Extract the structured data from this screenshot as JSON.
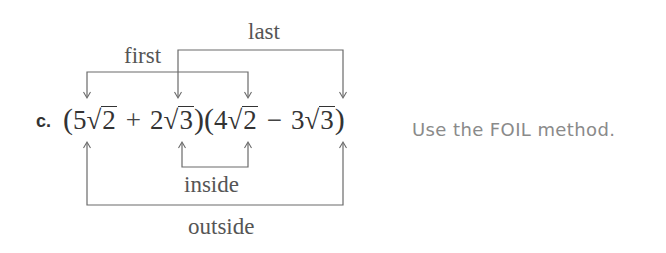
{
  "problem": {
    "item_letter": "c.",
    "expression": {
      "open_paren_1": "(",
      "term1": {
        "coefficient": "5",
        "radical_sign": "√",
        "radicand": "2"
      },
      "op1": "+",
      "term2": {
        "coefficient": "2",
        "radical_sign": "√",
        "radicand": "3"
      },
      "close_paren_1": ")",
      "open_paren_2": "(",
      "term3": {
        "coefficient": "4",
        "radical_sign": "√",
        "radicand": "2"
      },
      "op2": "−",
      "term4": {
        "coefficient": "3",
        "radical_sign": "√",
        "radicand": "3"
      },
      "close_paren_2": ")"
    },
    "hint": "Use the FOIL method."
  },
  "foil_labels": {
    "first": "first",
    "last": "last",
    "inside": "inside",
    "outside": "outside"
  },
  "colors": {
    "bracket_line": "#6a6a6a",
    "label_text": "#555555",
    "math_text": "#333333",
    "hint_text": "#8a8a8a",
    "background": "#ffffff"
  }
}
